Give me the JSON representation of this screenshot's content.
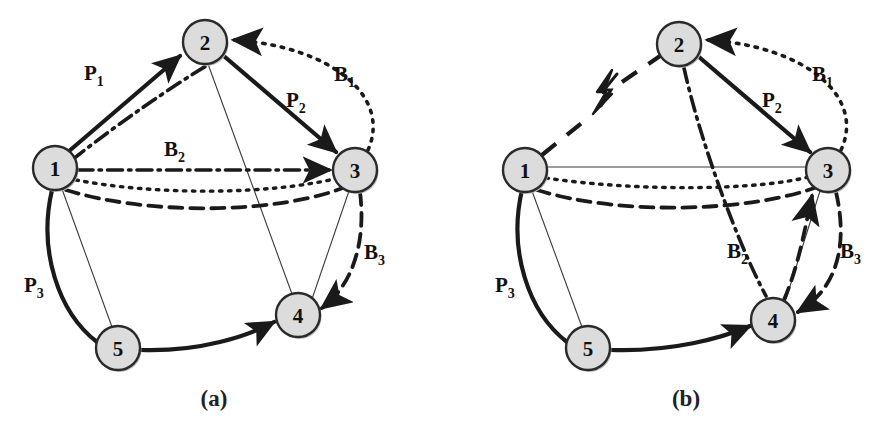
{
  "figure": {
    "background_color": "#ffffff",
    "ink_color": "#1a1a1a",
    "node_fill": "#dcdcdc",
    "node_stroke": "#2a2a2a",
    "node_radius": 22
  },
  "panels": [
    {
      "id": "a",
      "caption": "(a)",
      "caption_pos": {
        "x": 214,
        "y": 406
      },
      "nodes": [
        {
          "id": "1",
          "label": "1",
          "x": 55,
          "y": 168
        },
        {
          "id": "2",
          "label": "2",
          "x": 205,
          "y": 42
        },
        {
          "id": "3",
          "label": "3",
          "x": 355,
          "y": 170
        },
        {
          "id": "4",
          "label": "4",
          "x": 298,
          "y": 315
        },
        {
          "id": "5",
          "label": "5",
          "x": 118,
          "y": 348
        }
      ],
      "edge_labels": [
        {
          "base": "P",
          "sub": "1",
          "x": 84,
          "y": 80,
          "name": "label-p1"
        },
        {
          "base": "P",
          "sub": "2",
          "x": 286,
          "y": 107,
          "name": "label-p2"
        },
        {
          "base": "P",
          "sub": "3",
          "x": 24,
          "y": 292,
          "name": "label-p3"
        },
        {
          "base": "B",
          "sub": "1",
          "x": 334,
          "y": 81,
          "name": "label-b1"
        },
        {
          "base": "B",
          "sub": "2",
          "x": 164,
          "y": 156,
          "name": "label-b2"
        },
        {
          "base": "B",
          "sub": "3",
          "x": 364,
          "y": 259,
          "name": "label-b3"
        }
      ],
      "fault": null
    },
    {
      "id": "b",
      "caption": "(b)",
      "caption_pos": {
        "x": 686,
        "y": 406
      },
      "nodes": [
        {
          "id": "1",
          "label": "1",
          "x": 525,
          "y": 170
        },
        {
          "id": "2",
          "label": "2",
          "x": 679,
          "y": 44
        },
        {
          "id": "3",
          "label": "3",
          "x": 828,
          "y": 170
        },
        {
          "id": "4",
          "label": "4",
          "x": 773,
          "y": 320
        },
        {
          "id": "5",
          "label": "5",
          "x": 588,
          "y": 348
        }
      ],
      "edge_labels": [
        {
          "base": "P",
          "sub": "2",
          "x": 762,
          "y": 107,
          "name": "label-p2"
        },
        {
          "base": "P",
          "sub": "3",
          "x": 495,
          "y": 292,
          "name": "label-p3"
        },
        {
          "base": "B",
          "sub": "1",
          "x": 812,
          "y": 81,
          "name": "label-b1"
        },
        {
          "base": "B",
          "sub": "2",
          "x": 727,
          "y": 258,
          "name": "label-b2"
        },
        {
          "base": "B",
          "sub": "3",
          "x": 840,
          "y": 258,
          "name": "label-b3"
        }
      ],
      "fault": {
        "name": "link-failure-bolt",
        "x": 603,
        "y": 90,
        "on_link": "1-2"
      }
    }
  ],
  "legend_semantics": {
    "primary_paths": [
      "P1",
      "P2",
      "P3"
    ],
    "backup_paths": [
      "B1",
      "B2",
      "B3"
    ],
    "line_styles": {
      "primary": "solid-bold",
      "B1": "dotted",
      "B2": "dash-dot",
      "B3": "dashed",
      "reference": "thin-solid"
    }
  }
}
